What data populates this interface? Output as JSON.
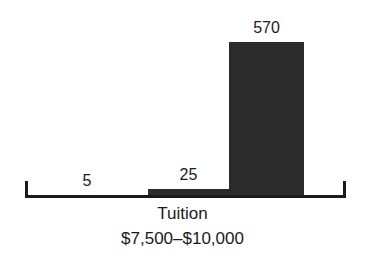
{
  "chart_data": {
    "type": "bar",
    "title": "",
    "subtitle": "",
    "categories": [
      "",
      "",
      ""
    ],
    "values": [
      5,
      25,
      570
    ],
    "value_labels": [
      "5",
      "25",
      "570"
    ],
    "series": [
      {
        "name": "Count",
        "values": [
          5,
          25,
          570
        ]
      }
    ],
    "xlabel": "Tuition $7,500–$10,000",
    "xlabel_lines": [
      "Tuition",
      "$7,500–$10,000"
    ],
    "ylabel": "",
    "ylim": [
      0,
      570
    ],
    "grid": false,
    "legend": false,
    "legend_position": "none",
    "axis": {
      "x_axis_visible": true,
      "y_axis_visible": false,
      "end_ticks": true,
      "tick_labels": []
    },
    "colors": {
      "bar": "#2b2b2b",
      "axis": "#1a1a1a",
      "text": "#1a1a1a",
      "background": "#ffffff"
    },
    "annotations": [
      {
        "text": "5",
        "target": "bar-1",
        "position": "above"
      },
      {
        "text": "25",
        "target": "bar-2",
        "position": "above"
      },
      {
        "text": "570",
        "target": "bar-3",
        "position": "above"
      }
    ]
  }
}
